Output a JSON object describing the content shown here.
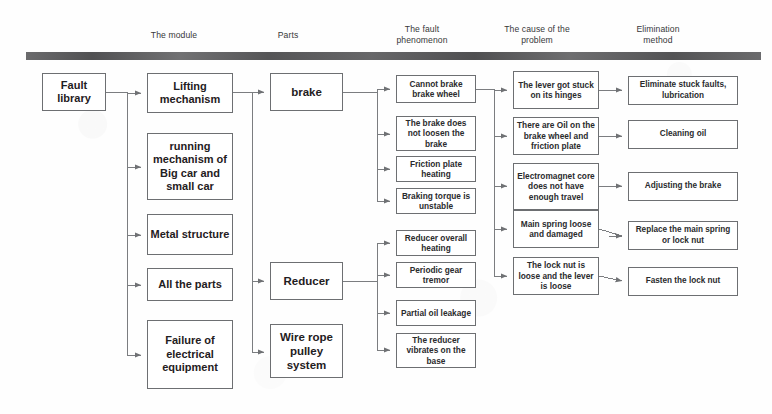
{
  "diagram": {
    "headers": [
      {
        "label": "The module",
        "x": 124,
        "y": 30,
        "w": 100
      },
      {
        "label": "Parts",
        "x": 243,
        "y": 30,
        "w": 90
      },
      {
        "label": "The fault\nphenomenon",
        "x": 372,
        "y": 25,
        "w": 100
      },
      {
        "label": "The cause of the\nproblem",
        "x": 482,
        "y": 25,
        "w": 110
      },
      {
        "label": "Elimination\nmethod",
        "x": 608,
        "y": 25,
        "w": 100
      }
    ],
    "columns": {
      "root": {
        "name": "fault-library",
        "nodes": [
          {
            "id": "root",
            "label": "Fault\nlibrary",
            "x": 42,
            "y": 73,
            "w": 64,
            "h": 38
          }
        ]
      },
      "module": {
        "name": "module-column",
        "nodes": [
          {
            "id": "m1",
            "label": "Lifting\nmechanism",
            "x": 147,
            "y": 73,
            "w": 86,
            "h": 40
          },
          {
            "id": "m2",
            "label": "running\nmechanism\nof Big car\nand small car",
            "x": 147,
            "y": 133,
            "w": 86,
            "h": 67
          },
          {
            "id": "m3",
            "label": "Metal\nstructure",
            "x": 147,
            "y": 214,
            "w": 86,
            "h": 41
          },
          {
            "id": "m4",
            "label": "All the parts",
            "x": 147,
            "y": 268,
            "w": 86,
            "h": 33
          },
          {
            "id": "m5",
            "label": "Failure of\nelectrical\nequipment",
            "x": 147,
            "y": 320,
            "w": 86,
            "h": 69
          }
        ]
      },
      "parts": {
        "name": "parts-column",
        "nodes": [
          {
            "id": "p1",
            "label": "brake",
            "x": 270,
            "y": 73,
            "w": 73,
            "h": 38
          },
          {
            "id": "p2",
            "label": "Reducer",
            "x": 270,
            "y": 262,
            "w": 73,
            "h": 38
          },
          {
            "id": "p3",
            "label": "Wire rope\npulley\nsystem",
            "x": 270,
            "y": 324,
            "w": 73,
            "h": 54
          }
        ]
      },
      "fault": {
        "name": "fault-phenomenon-column",
        "nodes": [
          {
            "id": "f1",
            "label": "Cannot brake\nbrake wheel",
            "x": 396,
            "y": 75,
            "w": 80,
            "h": 28
          },
          {
            "id": "f2",
            "label": "The brake does\nnot loosen the\nbrake",
            "x": 396,
            "y": 116,
            "w": 80,
            "h": 35
          },
          {
            "id": "f3",
            "label": "Friction plate\nheating",
            "x": 396,
            "y": 156,
            "w": 80,
            "h": 26
          },
          {
            "id": "f4",
            "label": "Braking torque is\nunstable",
            "x": 396,
            "y": 188,
            "w": 80,
            "h": 26
          },
          {
            "id": "f5",
            "label": "Reducer overall\nheating",
            "x": 396,
            "y": 230,
            "w": 80,
            "h": 26
          },
          {
            "id": "f6",
            "label": "Periodic gear\ntremor",
            "x": 396,
            "y": 262,
            "w": 80,
            "h": 26
          },
          {
            "id": "f7",
            "label": "Partial oil\nleakage",
            "x": 396,
            "y": 300,
            "w": 80,
            "h": 26
          },
          {
            "id": "f8",
            "label": "The reducer\nvibrates on the\nbase",
            "x": 396,
            "y": 333,
            "w": 80,
            "h": 35
          }
        ]
      },
      "cause": {
        "name": "cause-column",
        "nodes": [
          {
            "id": "c1",
            "label": "The lever got\nstuck on its\nhinges",
            "x": 513,
            "y": 71,
            "w": 86,
            "h": 38
          },
          {
            "id": "c2",
            "label": "There are Oil on\nthe brake wheel\nand friction plate",
            "x": 513,
            "y": 117,
            "w": 86,
            "h": 38
          },
          {
            "id": "c3",
            "label": "Electromagnet\ncore does not\nhave enough\ntravel",
            "x": 513,
            "y": 163,
            "w": 86,
            "h": 47
          },
          {
            "id": "c4",
            "label": "Main spring\nloose and\ndamaged",
            "x": 513,
            "y": 210,
            "w": 86,
            "h": 38
          },
          {
            "id": "c5",
            "label": "The lock nut is\nloose and the\nlever is loose",
            "x": 513,
            "y": 257,
            "w": 86,
            "h": 38
          }
        ]
      },
      "fix": {
        "name": "elimination-method-column",
        "nodes": [
          {
            "id": "e1",
            "label": "Eliminate stuck faults,\nlubrication",
            "x": 628,
            "y": 76,
            "w": 110,
            "h": 29
          },
          {
            "id": "e2",
            "label": "Cleaning oil",
            "x": 628,
            "y": 120,
            "w": 110,
            "h": 29
          },
          {
            "id": "e3",
            "label": "Adjusting the brake",
            "x": 628,
            "y": 172,
            "w": 110,
            "h": 29
          },
          {
            "id": "e4",
            "label": "Replace the main\nspring or lock nut",
            "x": 628,
            "y": 221,
            "w": 110,
            "h": 29
          },
          {
            "id": "e5",
            "label": "Fasten the lock nut",
            "x": 628,
            "y": 267,
            "w": 110,
            "h": 29
          }
        ]
      }
    },
    "colors": {
      "bar": "#5a5a5c",
      "box_border": "#6d6f72",
      "wire": "#77797c",
      "text": "#1f2022",
      "header_text": "#37383a",
      "background": "#fefefe"
    },
    "edges": {
      "root_to_modules": [
        "m1",
        "m2",
        "m3",
        "m4",
        "m5"
      ],
      "lifting_to_parts": [
        "p1",
        "p2",
        "p3"
      ],
      "brake_to_faults": [
        "f1",
        "f2",
        "f3",
        "f4"
      ],
      "reducer_to_faults": [
        "f5",
        "f6",
        "f7",
        "f8"
      ],
      "fault_to_causes": [
        "c1",
        "c2",
        "c3",
        "c4",
        "c5"
      ],
      "cause_to_fix": [
        {
          "from": "c1",
          "to": "e1"
        },
        {
          "from": "c2",
          "to": "e2"
        },
        {
          "from": "c3",
          "to": "e3"
        },
        {
          "from": "c4",
          "to": "e4"
        },
        {
          "from": "c5",
          "to": "e5"
        }
      ]
    }
  }
}
